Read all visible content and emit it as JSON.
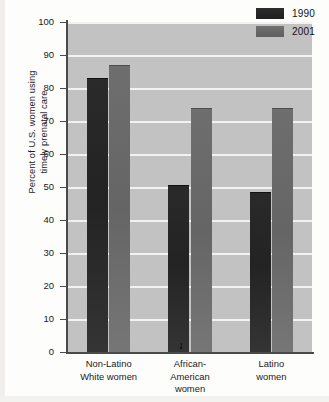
{
  "chart_data": {
    "type": "bar",
    "title": "",
    "xlabel": "",
    "ylabel": "Percent of U.S. women using timely prenatal care",
    "ylabel_lines": [
      "Percent of U.S. women using",
      "timely prenatal care"
    ],
    "ylim": [
      0,
      100
    ],
    "yticks": [
      0,
      10,
      20,
      30,
      40,
      50,
      60,
      70,
      80,
      90,
      100
    ],
    "ytick_labels": [
      "0",
      "10",
      "20",
      "30",
      "40",
      "50",
      "60",
      "70",
      "80",
      "90",
      "100"
    ],
    "grid": true,
    "grid_axis": "y",
    "legend_position": "top-right",
    "categories": [
      "Non-Latino White women",
      "African-American women",
      "Latino women"
    ],
    "category_label_lines": [
      [
        "Non-Latino",
        "White women"
      ],
      [
        "African-",
        "American",
        "women"
      ],
      [
        "Latino",
        "women"
      ]
    ],
    "series": [
      {
        "name": "1990",
        "color": "#262626",
        "values": [
          83,
          50.5,
          48.5
        ]
      },
      {
        "name": "2001",
        "color": "#6b6b6b",
        "values": [
          87,
          74,
          74
        ]
      }
    ]
  },
  "legend": {
    "items": [
      {
        "label": "1990"
      },
      {
        "label": "2001"
      }
    ]
  },
  "artifact": {
    "mark": "✓"
  }
}
